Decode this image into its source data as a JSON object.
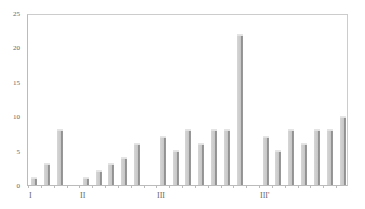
{
  "chart_data": {
    "type": "bar",
    "title": "",
    "xlabel": "",
    "ylabel": "",
    "ylim": [
      0,
      25
    ],
    "yticks": [
      0,
      5,
      10,
      15,
      20,
      25
    ],
    "grid": false,
    "legend": null,
    "group_labels": [
      "I",
      "II",
      "III",
      "III'"
    ],
    "groups": [
      {
        "label": "I",
        "values": [
          1,
          3,
          8
        ]
      },
      {
        "label": "II",
        "values": [
          1,
          2,
          3,
          4,
          6
        ]
      },
      {
        "label": "III",
        "values": [
          7,
          5,
          8,
          6,
          8,
          8,
          22
        ]
      },
      {
        "label": "III'",
        "values": [
          7,
          5,
          8,
          6,
          8,
          8,
          10
        ]
      }
    ],
    "colors": {
      "bar": "#c8c8c8",
      "bar_shadow": "#8e8e8e",
      "axis": "#bbbbbb"
    }
  }
}
